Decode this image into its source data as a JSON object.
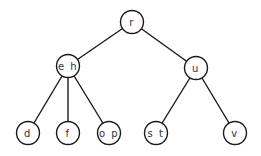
{
  "diagram": {
    "type": "tree",
    "nodes": [
      {
        "id": "r",
        "label": "r",
        "x": 132,
        "y": 22
      },
      {
        "id": "eh",
        "label": "e h",
        "x": 68,
        "y": 66
      },
      {
        "id": "u",
        "label": "u",
        "x": 196,
        "y": 68
      },
      {
        "id": "d",
        "label": "d",
        "x": 28,
        "y": 133
      },
      {
        "id": "f",
        "label": "f",
        "x": 68,
        "y": 133
      },
      {
        "id": "op",
        "label": "o p",
        "x": 109,
        "y": 133
      },
      {
        "id": "st",
        "label": "s t",
        "x": 156,
        "y": 133
      },
      {
        "id": "v",
        "label": "v",
        "x": 235,
        "y": 133
      }
    ],
    "edges": [
      [
        "r",
        "eh"
      ],
      [
        "r",
        "u"
      ],
      [
        "eh",
        "d"
      ],
      [
        "eh",
        "f"
      ],
      [
        "eh",
        "op"
      ],
      [
        "u",
        "st"
      ],
      [
        "u",
        "v"
      ]
    ]
  }
}
